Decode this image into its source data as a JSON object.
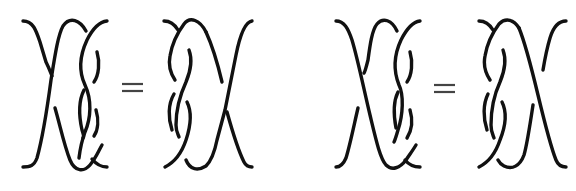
{
  "diagram": {
    "type": "braid-relation",
    "description": "Two braid identities, each showing two 3-strand braid diagrams joined by an equals sign",
    "stroke_color": "#111111",
    "equations": [
      {
        "left": {
          "label": "braid-1a",
          "strands": 3
        },
        "operator": "=",
        "right": {
          "label": "braid-1b",
          "strands": 3
        }
      },
      {
        "left": {
          "label": "braid-2a",
          "strands": 3
        },
        "operator": "=",
        "right": {
          "label": "braid-2b",
          "strands": 3
        }
      }
    ]
  }
}
